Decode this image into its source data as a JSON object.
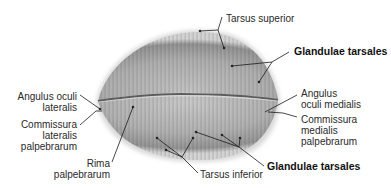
{
  "diagram": {
    "type": "anatomical-illustration",
    "colors": {
      "background": "#ffffff",
      "tissue_light": "#d8d8d8",
      "tissue_mid": "#a9a9a9",
      "tissue_dark": "#6e6e6e",
      "line": "#1a1a1a",
      "text": "#2a2a2a"
    },
    "labels": {
      "tarsus_superior": "Tarsus superior",
      "glandulae_tarsales_upper": "Glandulae tarsales",
      "angulus_oculi_medialis": [
        "Angulus",
        "oculi medialis"
      ],
      "commissura_medialis": [
        "Commissura",
        "medialis",
        "palpebrarum"
      ],
      "glandulae_tarsales_lower": "Glandulae tarsales",
      "tarsus_inferior": "Tarsus inferior",
      "rima_palpebrarum": [
        "Rima",
        "palpebrarum"
      ],
      "commissura_lateralis": [
        "Commissura",
        "lateralis",
        "palpebrarum"
      ],
      "angulus_oculi_lateralis": [
        "Angulus oculi",
        "lateralis"
      ]
    }
  }
}
